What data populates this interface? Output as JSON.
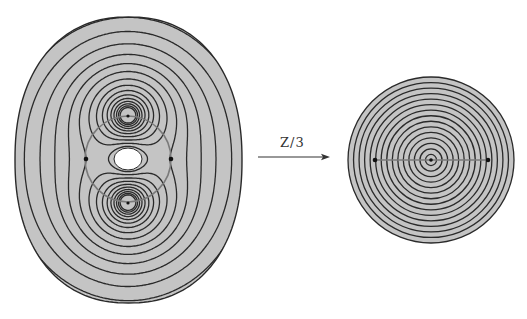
{
  "figure": {
    "background": "#ffffff",
    "fill_color": "#c4c4c4",
    "contour_color": "#2a2a2a",
    "circle_color": "#7a7a7a",
    "left_panel": {
      "description": "Level curves of a function on an oval domain with two focal critical points and a central hole",
      "bbox": {
        "x": 15,
        "y": 17,
        "w": 227,
        "h": 286
      },
      "center": [
        128,
        159
      ],
      "foci": [
        [
          128,
          116
        ],
        [
          128,
          203
        ]
      ],
      "saddle_points": [
        [
          86,
          159
        ],
        [
          171,
          159
        ]
      ],
      "hole": {
        "cx": 128,
        "cy": 159,
        "rx": 14,
        "ry": 11
      },
      "critical_circle": {
        "cx": 128,
        "cy": 159,
        "r": 43
      }
    },
    "arrow": {
      "x1": 258,
      "y1": 157,
      "x2": 330,
      "y2": 157,
      "label": "Z/3"
    },
    "right_panel": {
      "description": "Concentric circles on a disk with a center point and two marked points joined by a segment",
      "center": [
        431,
        160
      ],
      "radius": 83,
      "ring_count": 15,
      "marked_points": [
        [
          375,
          160
        ],
        [
          431,
          160
        ],
        [
          488,
          160
        ]
      ]
    }
  }
}
